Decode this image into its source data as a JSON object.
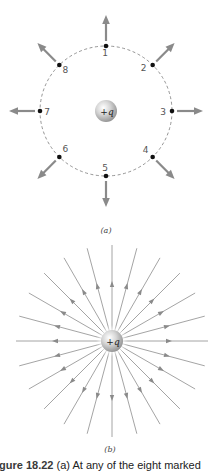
{
  "panel_a": {
    "label": "(a)",
    "charge_label": "+q",
    "circle": {
      "cx": 106,
      "cy": 111,
      "r": 65,
      "style": "dashed"
    },
    "points": [
      {
        "id": "1",
        "angle_deg": 90
      },
      {
        "id": "2",
        "angle_deg": 45
      },
      {
        "id": "3",
        "angle_deg": 0
      },
      {
        "id": "4",
        "angle_deg": -45
      },
      {
        "id": "5",
        "angle_deg": -90
      },
      {
        "id": "6",
        "angle_deg": -135
      },
      {
        "id": "7",
        "angle_deg": 180
      },
      {
        "id": "8",
        "angle_deg": 135
      }
    ],
    "arrow_direction": "radially outward",
    "arrow_color": "#8a8a8a"
  },
  "panel_b": {
    "label": "(b)",
    "charge_label": "+q",
    "center": {
      "cx": 112,
      "cy": 341
    },
    "line_count": 24,
    "line_spacing_deg": 15,
    "line_length": 96,
    "arrow_direction": "radially outward",
    "line_color": "#9a9a9a"
  },
  "caption": {
    "figure_number": "igure 18.22",
    "text": " (a) At any of the eight marked"
  },
  "colors": {
    "arrow": "#8a8a8a",
    "field_line": "#9d9d9d",
    "point": "#111111",
    "circle": "#777777",
    "sphere_light": "#f4f4f4",
    "sphere_dark": "#9c9c9c"
  }
}
